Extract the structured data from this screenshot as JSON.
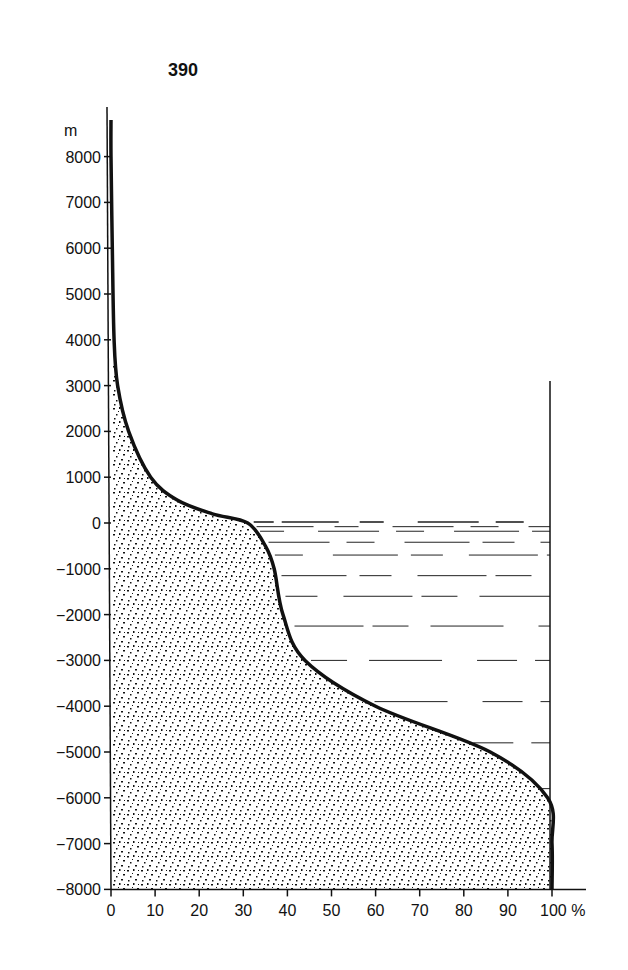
{
  "page": {
    "number": "390"
  },
  "chart_data": {
    "type": "area",
    "title": "",
    "subtitle": "Hypsographic curve of the Earth's surface (cumulative % of area above each elevation)",
    "xlabel": "%",
    "ylabel": "m",
    "xlim": [
      0,
      100
    ],
    "ylim": [
      -8000,
      8800
    ],
    "x_ticks": [
      0,
      10,
      20,
      30,
      40,
      50,
      60,
      70,
      80,
      90,
      100
    ],
    "x_tick_labels": [
      "0",
      "10",
      "20",
      "30",
      "40",
      "50",
      "60",
      "70",
      "80",
      "90",
      "100 %"
    ],
    "y_ticks": [
      8000,
      7000,
      6000,
      5000,
      4000,
      3000,
      2000,
      1000,
      0,
      -1000,
      -2000,
      -3000,
      -4000,
      -5000,
      -6000,
      -7000,
      -8000
    ],
    "y_tick_labels": [
      "8000",
      "7000",
      "6000",
      "5000",
      "4000",
      "3000",
      "2000",
      "1000",
      "0",
      "−1000",
      "−2000",
      "−3000",
      "−4000",
      "−5000",
      "−6000",
      "−7000",
      "−8000"
    ],
    "grid": false,
    "legend": null,
    "series": [
      {
        "name": "hypsographic curve",
        "points": [
          {
            "pct": 0,
            "elev": 8800
          },
          {
            "pct": 0,
            "elev": 8000
          },
          {
            "pct": 0.3,
            "elev": 6000
          },
          {
            "pct": 0.7,
            "elev": 4000
          },
          {
            "pct": 1.5,
            "elev": 3000
          },
          {
            "pct": 4,
            "elev": 2000
          },
          {
            "pct": 9,
            "elev": 1000
          },
          {
            "pct": 15,
            "elev": 500
          },
          {
            "pct": 23,
            "elev": 200
          },
          {
            "pct": 31,
            "elev": 0
          },
          {
            "pct": 35,
            "elev": -500
          },
          {
            "pct": 37,
            "elev": -1000
          },
          {
            "pct": 39,
            "elev": -2000
          },
          {
            "pct": 44,
            "elev": -3000
          },
          {
            "pct": 60,
            "elev": -4000
          },
          {
            "pct": 86,
            "elev": -5000
          },
          {
            "pct": 99,
            "elev": -6000
          },
          {
            "pct": 100,
            "elev": -7000
          },
          {
            "pct": 100,
            "elev": -8000
          }
        ]
      }
    ],
    "annotations": [
      "Land/seafloor area below the curve is stippled",
      "Ocean region (between sea level 0 m and the curve, right of it up to 100%) drawn with horizontal dashed water lines",
      "Vertical boundary line at 100% from about +3000 m down to -8000 m"
    ]
  }
}
